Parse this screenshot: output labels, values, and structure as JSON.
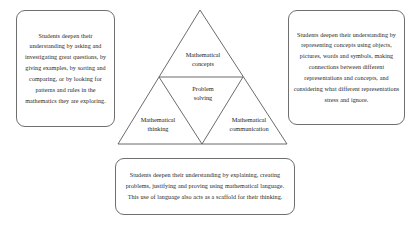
{
  "diagram": {
    "ink_color": "#262626",
    "line_color": "#5a5a5a",
    "background_color": "#ffffff",
    "triangle": {
      "nodes": [
        {
          "id": "concepts",
          "label_line1": "Mathematical",
          "label_line2": "concepts"
        },
        {
          "id": "problem-solving",
          "label_line1": "Problem",
          "label_line2": "solving"
        },
        {
          "id": "thinking",
          "label_line1": "Mathematical",
          "label_line2": "thinking"
        },
        {
          "id": "communication",
          "label_line1": "Mathematical",
          "label_line2": "communication"
        }
      ]
    }
  },
  "callouts": {
    "left": {
      "text": "Students deepen their understanding by asking and investigating great questions, by giving examples, by sorting and comparing, or by looking for patterns and rules in the mathematics they are exploring."
    },
    "right": {
      "text": "Students deepen their understanding by representing concepts using objects, pictures, words and symbols, making connections between different representations and concepts, and considering what different representations stress and ignore."
    },
    "bottom": {
      "text": "Students deepen their understanding by explaining, creating problems, justifying and proving using mathematical language. This use of language also acts as a scaffold for their thinking."
    }
  }
}
